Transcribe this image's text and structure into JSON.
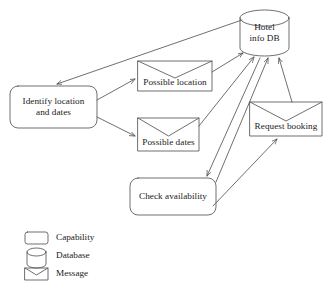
{
  "figure": {
    "type": "node-link-diagram",
    "background_color": "#ffffff",
    "stroke_color": "#555555",
    "text_color": "#202020"
  },
  "nodes": [
    {
      "id": "hotel_info_db",
      "label": "Hotel\ninfo DB",
      "shape": "database",
      "shape_name": "cylinder",
      "x": 240,
      "y": 10,
      "w": 49,
      "h": 46
    },
    {
      "id": "identify_location_and_dates",
      "label": "Identify location\nand dates",
      "shape": "capability",
      "shape_name": "rounded-rectangle",
      "x": 10,
      "y": 86,
      "w": 87,
      "h": 42
    },
    {
      "id": "possible_location",
      "label": "Possible location",
      "shape": "message",
      "shape_name": "envelope",
      "x": 138,
      "y": 61,
      "w": 74,
      "h": 30
    },
    {
      "id": "possible_dates",
      "label": "Possible dates",
      "shape": "message",
      "shape_name": "envelope",
      "x": 138,
      "y": 118,
      "w": 61,
      "h": 33
    },
    {
      "id": "request_booking",
      "label": "Request booking",
      "shape": "message",
      "shape_name": "envelope",
      "x": 250,
      "y": 102,
      "w": 72,
      "h": 34
    },
    {
      "id": "check_availability",
      "label": "Check availability",
      "shape": "capability",
      "shape_name": "rounded-rectangle",
      "x": 130,
      "y": 178,
      "w": 86,
      "h": 37
    }
  ],
  "edges": [
    {
      "id": "db-to-identify",
      "from": "hotel_info_db",
      "to": "identify_location_and_dates",
      "arrow": "end"
    },
    {
      "id": "identify-to-possible-loc",
      "from": "identify_location_and_dates",
      "to": "possible_location",
      "arrow": "end"
    },
    {
      "id": "identify-to-possible-dates",
      "from": "identify_location_and_dates",
      "to": "possible_dates",
      "arrow": "end"
    },
    {
      "id": "possible-loc-to-db",
      "from": "possible_location",
      "to": "hotel_info_db",
      "arrow": "end"
    },
    {
      "id": "possible-dates-to-db",
      "from": "possible_dates",
      "to": "hotel_info_db",
      "arrow": "end"
    },
    {
      "id": "db-to-check-availability",
      "from": "hotel_info_db",
      "to": "check_availability",
      "arrow": "end"
    },
    {
      "id": "check-availability-to-db",
      "from": "check_availability",
      "to": "hotel_info_db",
      "arrow": "end"
    },
    {
      "id": "check-to-request-booking",
      "from": "check_availability",
      "to": "request_booking",
      "arrow": "end"
    },
    {
      "id": "request-booking-to-db",
      "from": "request_booking",
      "to": "hotel_info_db",
      "arrow": "end"
    }
  ],
  "legend": {
    "items": [
      {
        "id": "capability",
        "label": "Capability",
        "shape_name": "rounded-rectangle"
      },
      {
        "id": "database",
        "label": "Database",
        "shape_name": "cylinder"
      },
      {
        "id": "message",
        "label": "Message",
        "shape_name": "envelope"
      }
    ]
  }
}
